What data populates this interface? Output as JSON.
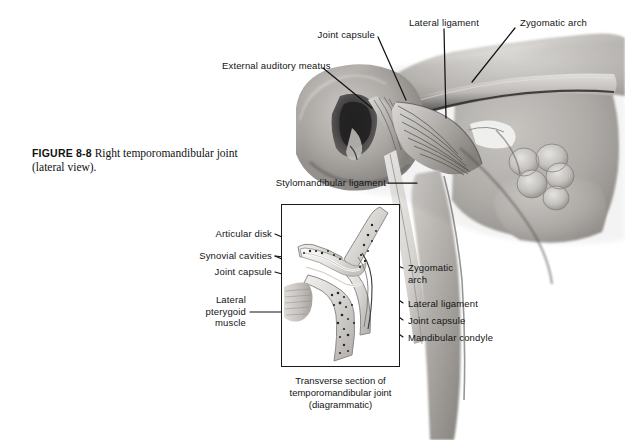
{
  "figure": {
    "number": "FIGURE 8-8",
    "caption_line1": "Right temporomandibular joint",
    "caption_line2": "(lateral view)."
  },
  "main_illustration": {
    "description": "lateral-view-temporomandibular-joint",
    "labels": [
      {
        "id": "joint-capsule",
        "text": "Joint capsule"
      },
      {
        "id": "lateral-ligament",
        "text": "Lateral ligament"
      },
      {
        "id": "zygomatic-arch",
        "text": "Zygomatic arch"
      },
      {
        "id": "external-auditory-meatus",
        "text": "External auditory meatus"
      },
      {
        "id": "stylomandibular-ligament",
        "text": "Stylomandibular ligament"
      }
    ]
  },
  "inset": {
    "description": "transverse-section-diagram",
    "caption_line1": "Transverse section of",
    "caption_line2": "temporomandibular joint",
    "caption_line3": "(diagrammatic)",
    "left_labels": [
      {
        "id": "articular-disk",
        "text": "Articular disk"
      },
      {
        "id": "synovial-cavities",
        "text": "Synovial cavities"
      },
      {
        "id": "joint-capsule",
        "text": "Joint capsule"
      },
      {
        "id": "lateral-pterygoid-muscle",
        "line1": "Lateral",
        "line2": "pterygoid",
        "line3": "muscle"
      }
    ],
    "right_labels": [
      {
        "id": "zygomatic-arch",
        "line1": "Zygomatic",
        "line2": "arch"
      },
      {
        "id": "lateral-ligament",
        "text": "Lateral ligament"
      },
      {
        "id": "joint-capsule",
        "text": "Joint capsule"
      },
      {
        "id": "mandibular-condyle",
        "text": "Mandibular condyle"
      }
    ]
  },
  "colors": {
    "background": "#ffffff",
    "ink": "#141414",
    "leader_line": "#121212",
    "frame": "#1a1a1a",
    "tissue_light": "#dcdad6",
    "tissue_mid": "#a9a6a2",
    "tissue_dark": "#6e6b68",
    "tissue_shadow": "#39383a"
  }
}
